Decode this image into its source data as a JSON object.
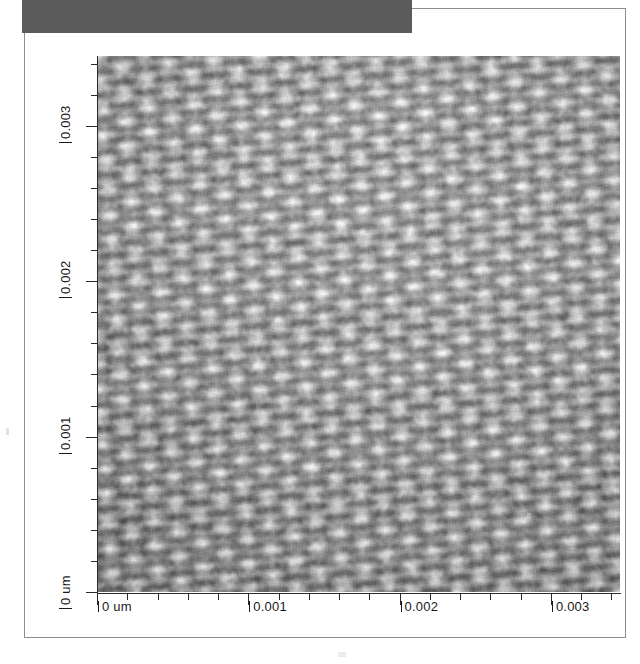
{
  "figure": {
    "header_block_color": "#5b5b5b",
    "page_background": "#ffffff",
    "page_border_color": "#8e8e8e"
  },
  "chart_data": {
    "type": "heatmap",
    "title": "",
    "subtitle": "",
    "xlabel": "",
    "ylabel": "",
    "grid": false,
    "legend": null,
    "colormap": "grayscale",
    "x_unit": "um",
    "y_unit": "um",
    "xlim": [
      0,
      0.00345
    ],
    "ylim": [
      0,
      0.00345
    ],
    "x_major_ticks": [
      0,
      0.001,
      0.002,
      0.003
    ],
    "y_major_ticks": [
      0,
      0.001,
      0.002,
      0.003
    ],
    "x_tick_labels": [
      "0 um",
      "0.001",
      "0.002",
      "0.003"
    ],
    "y_tick_labels": [
      "0 um",
      "0.001",
      "0.002",
      "0.003"
    ],
    "minor_ticks_per_major": 5,
    "lattice": {
      "period_x_um": 0.000152,
      "period_y_um": 0.000152,
      "rotation_deg": -4,
      "amplitude": 1.0
    },
    "value_range": [
      0,
      1
    ],
    "value_unit": "normalized height"
  },
  "axes": {
    "y": {
      "labels": [
        {
          "text": "0.003",
          "value": 0.003
        },
        {
          "text": "0.002",
          "value": 0.002
        },
        {
          "text": "0.001",
          "value": 0.001
        },
        {
          "text": "0 um",
          "value": 0
        }
      ]
    },
    "x": {
      "labels": [
        {
          "text": "0 um",
          "value": 0
        },
        {
          "text": "0.001",
          "value": 0.001
        },
        {
          "text": "0.002",
          "value": 0.002
        },
        {
          "text": "0.003",
          "value": 0.003
        }
      ]
    }
  }
}
